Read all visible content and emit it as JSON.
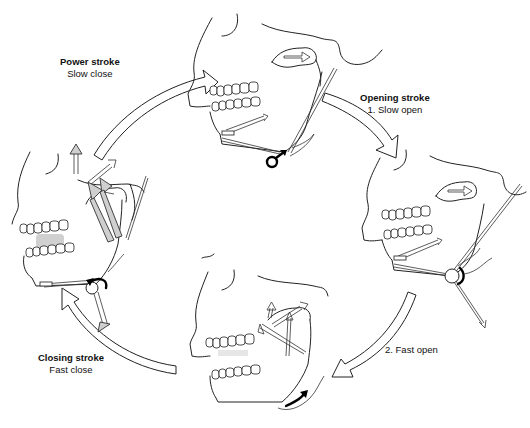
{
  "diagram": {
    "stages": [
      {
        "id": "power",
        "title": "Power stroke",
        "subtitle": "Slow close"
      },
      {
        "id": "opening",
        "title": "Opening stroke",
        "subtitle": "1. Slow open"
      },
      {
        "id": "fast-open",
        "title": "",
        "subtitle": "2. Fast open"
      },
      {
        "id": "closing",
        "title": "Closing stroke",
        "subtitle": "Fast close"
      }
    ],
    "figures": [
      {
        "id": "top",
        "description": "Skull with jaw closed, muscle vectors, condyle retracted"
      },
      {
        "id": "right",
        "description": "Skull with jaw slightly open (slow open)"
      },
      {
        "id": "bottom",
        "description": "Skull with jaw wide open (fast open)"
      },
      {
        "id": "left",
        "description": "Skull with jaw closing, large grey muscle vectors, food bolus between teeth"
      }
    ],
    "colors": {
      "line": "#222222",
      "muscle_fill": "#cfcfcf",
      "bolus": "#d0d0d0",
      "background": "#ffffff"
    }
  }
}
